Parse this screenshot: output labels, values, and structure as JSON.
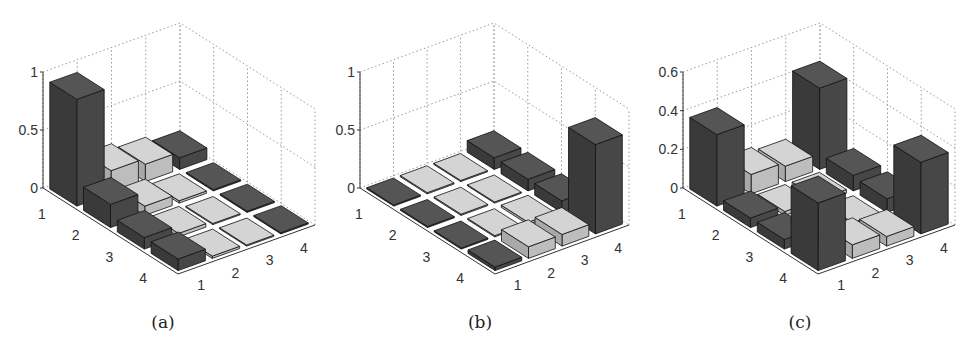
{
  "figure": {
    "captions": [
      "(a)",
      "(b)",
      "(c)"
    ]
  },
  "style": {
    "dark_bar": "#474747",
    "dark_bar_side": "#3a3a3a",
    "dark_bar_top": "#555555",
    "light_bar": "#bdbdbd",
    "light_bar_side": "#a9a9a9",
    "light_bar_top": "#d4d4d4",
    "grid": "#9a9a9a",
    "axis": "#333333"
  },
  "chart_data": [
    {
      "type": "bar3d",
      "title": "(a)",
      "row_labels": [
        "1",
        "2",
        "3",
        "4"
      ],
      "col_labels": [
        "1",
        "2",
        "3",
        "4"
      ],
      "zlim": [
        0,
        1
      ],
      "zticks": [
        "0",
        "0.5",
        "1"
      ],
      "ztick_values": [
        0,
        0.5,
        1
      ],
      "grid": true,
      "dark_columns": [
        1,
        4
      ],
      "values": [
        [
          0.92,
          0.2,
          0.15,
          0.1
        ],
        [
          0.2,
          0.08,
          0.02,
          0.01
        ],
        [
          0.1,
          0.03,
          0.01,
          0.01
        ],
        [
          0.1,
          0.02,
          0.01,
          0.01
        ]
      ]
    },
    {
      "type": "bar3d",
      "title": "(b)",
      "row_labels": [
        "1",
        "2",
        "3",
        "4"
      ],
      "col_labels": [
        "1",
        "2",
        "3",
        "4"
      ],
      "zlim": [
        0,
        1
      ],
      "zticks": [
        "0",
        "0.5",
        "1"
      ],
      "ztick_values": [
        0,
        0.5,
        1
      ],
      "grid": true,
      "dark_columns": [
        1,
        4
      ],
      "values": [
        [
          0.01,
          0.01,
          0.01,
          0.1
        ],
        [
          0.01,
          0.01,
          0.01,
          0.1
        ],
        [
          0.01,
          0.01,
          0.02,
          0.1
        ],
        [
          0.03,
          0.1,
          0.1,
          0.77
        ]
      ]
    },
    {
      "type": "bar3d",
      "title": "(c)",
      "row_labels": [
        "1",
        "2",
        "3",
        "4"
      ],
      "col_labels": [
        "1",
        "2",
        "3",
        "4"
      ],
      "zlim": [
        0,
        0.6
      ],
      "zticks": [
        "0",
        "0.2",
        "0.4",
        "0.6"
      ],
      "ztick_values": [
        0,
        0.2,
        0.4,
        0.6
      ],
      "grid": true,
      "dark_columns": [
        1,
        4
      ],
      "values": [
        [
          0.37,
          0.1,
          0.08,
          0.42
        ],
        [
          0.05,
          0.02,
          0.02,
          0.08
        ],
        [
          0.05,
          0.02,
          0.01,
          0.07
        ],
        [
          0.35,
          0.07,
          0.05,
          0.37
        ]
      ]
    }
  ],
  "panels": [
    {
      "offset_x": 0,
      "zaxis_x": 43,
      "z0_y": 188,
      "ztop_y": 72,
      "back_x": 180
    },
    {
      "offset_x": 317,
      "zaxis_x": 43,
      "z0_y": 188,
      "ztop_y": 72,
      "back_x": 177
    },
    {
      "offset_x": 640,
      "zaxis_x": 43,
      "z0_y": 188,
      "ztop_y": 72,
      "back_x": 180
    }
  ]
}
